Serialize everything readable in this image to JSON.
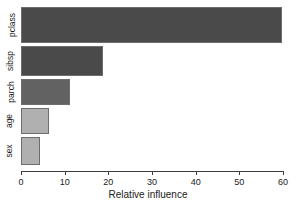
{
  "chart_data": {
    "type": "bar",
    "orientation": "horizontal",
    "title": "",
    "xlabel": "Relative influence",
    "ylabel": "",
    "categories": [
      "pclass",
      "sibsp",
      "parch",
      "age",
      "sex"
    ],
    "values": [
      59.8,
      18.8,
      11.3,
      6.5,
      4.4
    ],
    "xlim": [
      0,
      60
    ],
    "ylim": null,
    "xticks": [
      0,
      10,
      20,
      30,
      40,
      50,
      60
    ],
    "xticklabels": [
      "0",
      "10",
      "20",
      "30",
      "40",
      "50",
      "60"
    ],
    "grid": false,
    "legend": null,
    "bar_colors": [
      "#4a4a4a",
      "#4a4a4a",
      "#626262",
      "#b0b0b0",
      "#b0b0b0"
    ],
    "bar_edge_color": "#6d6d6d",
    "axis_color": "#3d3d3d",
    "background": "#ffffff"
  },
  "axis": {
    "x_title": "Relative influence"
  }
}
